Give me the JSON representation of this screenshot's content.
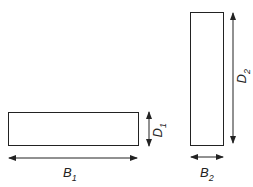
{
  "diagram": {
    "shapes": [
      {
        "id": "beam-1",
        "description": "wide flat rectangle",
        "dims": {
          "width_label": "B",
          "width_sub": "1",
          "depth_label": "D",
          "depth_sub": "1"
        }
      },
      {
        "id": "beam-2",
        "description": "tall narrow rectangle",
        "dims": {
          "width_label": "B",
          "width_sub": "2",
          "depth_label": "D",
          "depth_sub": "2"
        }
      }
    ],
    "colors": {
      "stroke": "#222222",
      "background": "#ffffff"
    }
  }
}
